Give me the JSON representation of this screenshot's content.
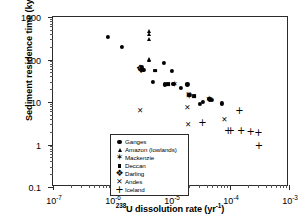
{
  "chart_data": {
    "type": "scatter",
    "title": "",
    "xlabel": "238U dissolution rate (yr-1)",
    "xlabel_base": "U dissolution rate (yr",
    "xlabel_sup_pre": "238",
    "xlabel_sup_post": "-1",
    "xlabel_tail": ")",
    "ylabel": "Sediment residence time (kyr)",
    "xscale": "log",
    "yscale": "log",
    "xlim": [
      1e-07,
      0.001
    ],
    "ylim": [
      0.1,
      1000
    ],
    "grid": false,
    "legend_position": "lower-left-inside",
    "xticks": [
      {
        "value": 1e-07,
        "label_base": "10",
        "label_exp": "-7"
      },
      {
        "value": 1e-06,
        "label_base": "10",
        "label_exp": "-6"
      },
      {
        "value": 1e-05,
        "label_base": "10",
        "label_exp": "-5"
      },
      {
        "value": 0.0001,
        "label_base": "10",
        "label_exp": "-4"
      },
      {
        "value": 0.001,
        "label_base": "10",
        "label_exp": "-3"
      }
    ],
    "yticks": [
      {
        "value": 1000,
        "label": "1000"
      },
      {
        "value": 100,
        "label": "100"
      },
      {
        "value": 10,
        "label": "10"
      },
      {
        "value": 1,
        "label": "1"
      },
      {
        "value": 0.1,
        "label": "0.1"
      }
    ],
    "series": [
      {
        "name": "Ganges",
        "marker": "circle",
        "color": "#000000",
        "points": [
          [
            8.5e-07,
            340
          ],
          [
            1.45e-06,
            195
          ],
          [
            3.2e-06,
            66
          ],
          [
            3.25e-06,
            60
          ],
          [
            3.4e-06,
            57
          ],
          [
            4.9e-06,
            30
          ],
          [
            7.6e-06,
            84
          ],
          [
            1.05e-05,
            55
          ],
          [
            7.9e-06,
            26
          ],
          [
            1.1e-05,
            27
          ],
          [
            1.45e-05,
            21
          ],
          [
            1.9e-05,
            26
          ],
          [
            2.05e-05,
            15
          ],
          [
            2e-05,
            14.5
          ],
          [
            3.1e-05,
            9.2
          ],
          [
            3.5e-05,
            10
          ],
          [
            4.4e-05,
            12
          ],
          [
            4.6e-05,
            11.5
          ],
          [
            4.9e-05,
            11
          ],
          [
            7.2e-05,
            9.3
          ]
        ]
      },
      {
        "name": "Amazon (lowlands)",
        "marker": "triangle",
        "color": "#000000",
        "points": [
          [
            4.3e-06,
            470
          ],
          [
            4.3e-06,
            390
          ],
          [
            4.25e-06,
            300
          ],
          [
            4.2e-06,
            105
          ],
          [
            4.3e-06,
            100
          ]
        ]
      },
      {
        "name": "Mackenzie",
        "marker": "star",
        "color": "#000000",
        "points": [
          [
            1.15e-05,
            27
          ],
          [
            2e-05,
            14.8
          ],
          [
            2.05e-05,
            14
          ],
          [
            4.4e-05,
            12
          ],
          [
            4.55e-05,
            11.6
          ]
        ]
      },
      {
        "name": "Deccan",
        "marker": "square",
        "color": "#000000",
        "points": [
          [
            5.4e-06,
            55
          ],
          [
            9e-06,
            26
          ],
          [
            2.45e-05,
            13.5
          ]
        ]
      },
      {
        "name": "Darling",
        "marker": "cross-filled",
        "color": "#000000",
        "points": [
          [
            3e-06,
            63
          ],
          [
            3.1e-06,
            58
          ]
        ]
      },
      {
        "name": "Andes",
        "marker": "x",
        "color": "#000000",
        "points": [
          [
            3e-06,
            6.2
          ],
          [
            1.9e-05,
            7.4
          ],
          [
            2e-05,
            14.6
          ],
          [
            1.95e-05,
            2.9
          ],
          [
            8e-05,
            3.7
          ]
        ]
      },
      {
        "name": "Iceland",
        "marker": "plus",
        "color": "#000000",
        "points": [
          [
            3.4e-05,
            3.2
          ],
          [
            9.3e-05,
            2.05
          ],
          [
            0.000103,
            2.05
          ],
          [
            0.000145,
            6.1
          ],
          [
            0.000155,
            2.05
          ],
          [
            0.000225,
            2.0
          ],
          [
            0.000305,
            1.85
          ],
          [
            0.00031,
            0.93
          ]
        ]
      }
    ]
  },
  "legend": {
    "items": [
      {
        "label": "Ganges",
        "marker": "circle"
      },
      {
        "label": "Amazon (lowlands)",
        "marker": "triangle"
      },
      {
        "label": "Mackenzie",
        "marker": "star"
      },
      {
        "label": "Deccan",
        "marker": "square"
      },
      {
        "label": "Darling",
        "marker": "cross-filled"
      },
      {
        "label": "Andes",
        "marker": "x"
      },
      {
        "label": "Iceland",
        "marker": "plus"
      }
    ]
  }
}
